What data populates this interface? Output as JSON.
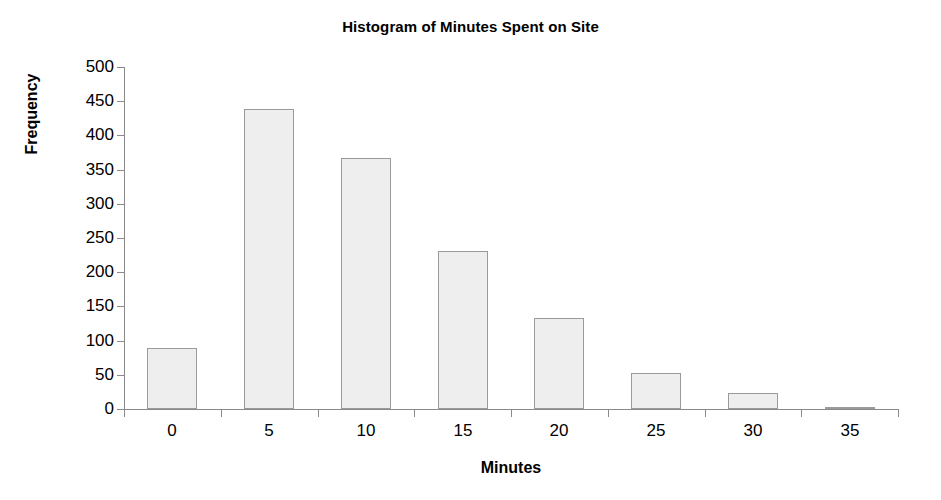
{
  "chart_data": {
    "type": "bar",
    "title": "Histogram of Minutes Spent on Site",
    "xlabel": "Minutes",
    "ylabel": "Frequency",
    "categories": [
      "0",
      "5",
      "10",
      "15",
      "20",
      "25",
      "30",
      "35"
    ],
    "values": [
      89,
      438,
      367,
      231,
      133,
      53,
      23,
      3
    ],
    "x_tick_labels": [
      "0",
      "5",
      "10",
      "15",
      "20",
      "25",
      "30",
      "35"
    ],
    "y_tick_labels": [
      "0",
      "50",
      "100",
      "150",
      "200",
      "250",
      "300",
      "350",
      "400",
      "450",
      "500"
    ],
    "y_ticks": [
      0,
      50,
      100,
      150,
      200,
      250,
      300,
      350,
      400,
      450,
      500
    ],
    "ylim": [
      0,
      500
    ],
    "grid": false,
    "legend": false,
    "bar_fill_color": "#eeeeee",
    "bar_border_color": "#9a9a9a",
    "axis_color": "#8a8a8a",
    "text_color": "#000000",
    "background_color": "#ffffff"
  }
}
